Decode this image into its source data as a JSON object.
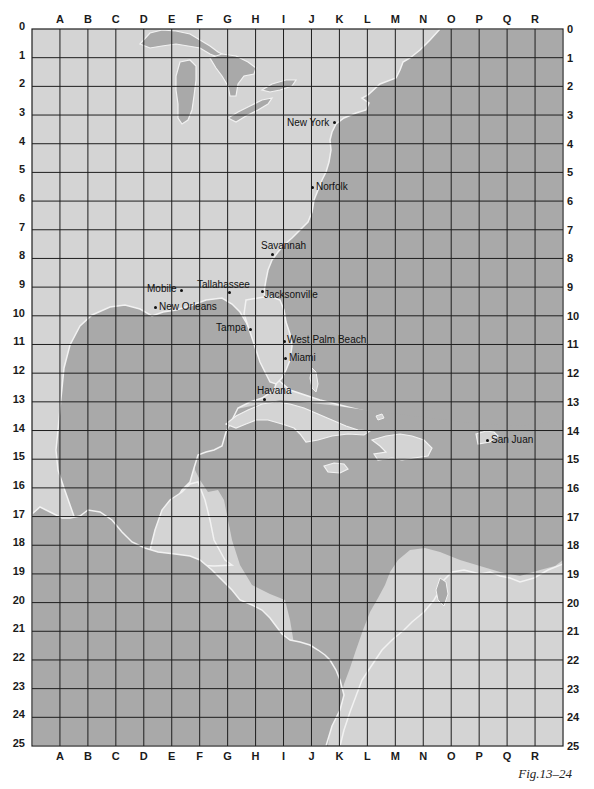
{
  "map": {
    "title": "Grid map of eastern United States, Gulf of Mexico and Caribbean",
    "columns": [
      "A",
      "B",
      "C",
      "D",
      "E",
      "F",
      "G",
      "H",
      "I",
      "J",
      "K",
      "L",
      "M",
      "N",
      "O",
      "P",
      "Q",
      "R"
    ],
    "rows": [
      "0",
      "1",
      "2",
      "3",
      "4",
      "5",
      "6",
      "7",
      "8",
      "9",
      "10",
      "11",
      "12",
      "13",
      "14",
      "15",
      "16",
      "17",
      "18",
      "19",
      "20",
      "21",
      "22",
      "23",
      "24",
      "25"
    ],
    "colors": {
      "land": "#d4d4d4",
      "water": "#a9a9a9",
      "coastline": "#f2f2f2",
      "grid": "#1e1e1e"
    },
    "cities": [
      {
        "name": "New York",
        "grid": "K3",
        "label_side": "left"
      },
      {
        "name": "Norfolk",
        "grid": "J5",
        "label_side": "right"
      },
      {
        "name": "Savannah",
        "grid": "I7",
        "label_side": "above"
      },
      {
        "name": "Mobile",
        "grid": "E9",
        "label_side": "left"
      },
      {
        "name": "Tallahassee",
        "grid": "G9",
        "label_side": "above"
      },
      {
        "name": "Jacksonville",
        "grid": "H9",
        "label_side": "right"
      },
      {
        "name": "New Orleans",
        "grid": "D9",
        "label_side": "right"
      },
      {
        "name": "Tampa",
        "grid": "H10",
        "label_side": "left"
      },
      {
        "name": "West Palm Beach",
        "grid": "I10",
        "label_side": "right"
      },
      {
        "name": "Miami",
        "grid": "I11",
        "label_side": "right"
      },
      {
        "name": "Havana",
        "grid": "H12",
        "label_side": "above"
      },
      {
        "name": "San Juan",
        "grid": "P14",
        "label_side": "right"
      }
    ],
    "caption": "Fig.13–24"
  }
}
